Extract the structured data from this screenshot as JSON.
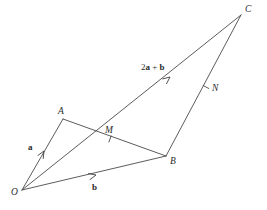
{
  "figure": {
    "background_color": "#ffffff",
    "line_color": "#4a4a4a",
    "text_color": "#2b2b2b",
    "points": [
      {
        "id": "O",
        "label": "O",
        "x": 22,
        "y": 190,
        "label_x": 11,
        "label_y": 195
      },
      {
        "id": "A",
        "label": "A",
        "x": 63,
        "y": 119,
        "label_x": 58,
        "label_y": 114
      },
      {
        "id": "B",
        "label": "B",
        "x": 166,
        "y": 156,
        "label_x": 170,
        "label_y": 164
      },
      {
        "id": "C",
        "label": "C",
        "x": 241,
        "y": 15,
        "label_x": 245,
        "label_y": 12
      },
      {
        "id": "M",
        "label": "M",
        "x": 97,
        "y": 131,
        "label_x": 105,
        "label_y": 133
      },
      {
        "id": "N",
        "label": "N",
        "x": 206,
        "y": 87,
        "label_x": 212,
        "label_y": 91
      }
    ],
    "segments": [
      {
        "id": "OA",
        "from": "O",
        "to": "A"
      },
      {
        "id": "OB",
        "from": "O",
        "to": "B"
      },
      {
        "id": "AB",
        "from": "A",
        "to": "B"
      },
      {
        "id": "OC",
        "from": "O",
        "to": "C"
      },
      {
        "id": "BC",
        "from": "B",
        "to": "C"
      }
    ],
    "ticks": [
      {
        "id": "tick-M",
        "on_segment": "AB",
        "x": 110,
        "y": 139
      },
      {
        "id": "tick-N",
        "on_segment": "BC",
        "x": 206,
        "y": 87
      }
    ],
    "vectors": [
      {
        "id": "vec-a",
        "label": "a",
        "on_segment": "OA",
        "label_x": 28,
        "label_y": 150,
        "arrow_x": 44,
        "arrow_y": 151
      },
      {
        "id": "vec-b",
        "label": "b",
        "on_segment": "OB",
        "label_x": 92,
        "label_y": 190,
        "arrow_x": 96,
        "arrow_y": 175
      },
      {
        "id": "vec-2a-plus-b",
        "label": "2a + b",
        "label_parts": {
          "coeff": "2",
          "first": "a",
          "plus": " + ",
          "second": "b"
        },
        "on_segment": "OC",
        "label_x": 141,
        "label_y": 70,
        "arrow_x": 170,
        "arrow_y": 77
      }
    ]
  }
}
